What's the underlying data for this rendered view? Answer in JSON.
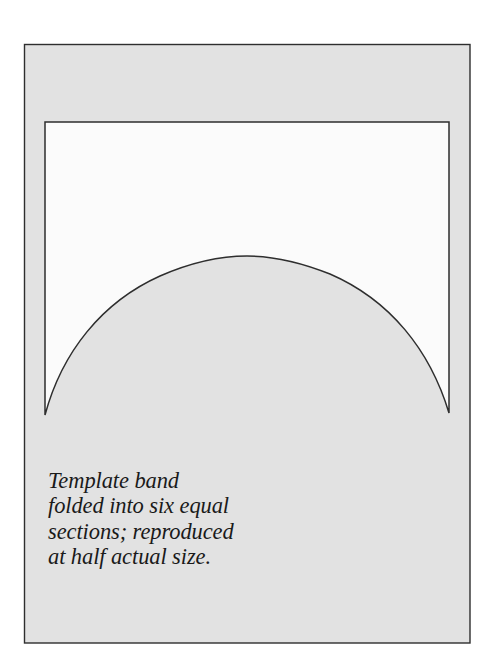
{
  "figure": {
    "type": "template-diagram",
    "colors": {
      "background": "#ffffff",
      "frame_fill": "#e2e2e2",
      "template_fill": "#fbfbfb",
      "line": "#2e2e2e",
      "text": "#1a1a1a"
    },
    "frame": {
      "x": 24,
      "y": 44,
      "width": 446,
      "height": 599
    },
    "template_shape": {
      "description": "Rectangle with concave arched bottom edge (band template)",
      "left_x": 45,
      "right_x": 449,
      "top_y": 122,
      "left_bottom_y": 415,
      "right_bottom_y": 413,
      "apex_x": 247,
      "apex_y": 256
    }
  },
  "caption": {
    "lines": [
      "Template band",
      "folded into six equal",
      "sections; reproduced",
      "at half actual size."
    ]
  }
}
